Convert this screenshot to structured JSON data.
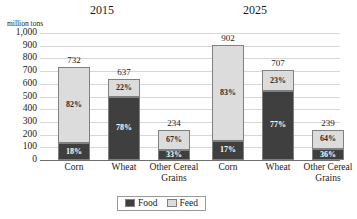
{
  "chart_data": {
    "type": "bar",
    "subtype": "stacked-bar-percent",
    "title": "",
    "panels": [
      {
        "label": "2015",
        "categories": [
          "Corn",
          "Wheat",
          "Other Cereal Grains"
        ],
        "totals": [
          732,
          637,
          234
        ],
        "series": [
          {
            "name": "Food",
            "percents": [
              18,
              78,
              33
            ],
            "percent_labels": [
              "18%",
              "78%",
              "33%"
            ]
          },
          {
            "name": "Feed",
            "percents": [
              82,
              22,
              67
            ],
            "percent_labels": [
              "82%",
              "22%",
              "67%"
            ]
          }
        ]
      },
      {
        "label": "2025",
        "categories": [
          "Corn",
          "Wheat",
          "Other Cereal Grains"
        ],
        "totals": [
          902,
          707,
          239
        ],
        "series": [
          {
            "name": "Food",
            "percents": [
              17,
              77,
              36
            ],
            "percent_labels": [
              "17%",
              "77%",
              "36%"
            ]
          },
          {
            "name": "Feed",
            "percents": [
              83,
              23,
              64
            ],
            "percent_labels": [
              "83%",
              "23%",
              "64%"
            ]
          }
        ]
      }
    ],
    "xlabel": "",
    "ylabel": "million tons",
    "ylim": [
      0,
      1000
    ],
    "ytick_labels": [
      "1,000",
      "900",
      "800",
      "700",
      "600",
      "500",
      "400",
      "300",
      "200",
      "100",
      "0"
    ],
    "ytick_values": [
      1000,
      900,
      800,
      700,
      600,
      500,
      400,
      300,
      200,
      100,
      0
    ],
    "grid": true,
    "legend_position": "bottom",
    "legend": [
      "Food",
      "Feed"
    ],
    "colors": {
      "food": "#3f3f3f",
      "feed": "#dcdcdc",
      "gridline": "#d7d7d7",
      "axis": "#6f6f6f"
    }
  },
  "axis": {
    "unit_label": "million tons",
    "ticks": [
      {
        "label": "1,000"
      },
      {
        "label": "900"
      },
      {
        "label": "800"
      },
      {
        "label": "700"
      },
      {
        "label": "600"
      },
      {
        "label": "500"
      },
      {
        "label": "400"
      },
      {
        "label": "300"
      },
      {
        "label": "200"
      },
      {
        "label": "100"
      },
      {
        "label": "0"
      }
    ]
  },
  "panels": {
    "left": {
      "title": "2015",
      "bars": [
        {
          "category": "Corn",
          "total_label": "732",
          "food_label": "18%",
          "feed_label": "82%"
        },
        {
          "category": "Wheat",
          "total_label": "637",
          "food_label": "78%",
          "feed_label": "22%"
        },
        {
          "category": "Other Cereal Grains",
          "category_line1": "Other Cereal",
          "category_line2": "Grains",
          "total_label": "234",
          "food_label": "33%",
          "feed_label": "67%"
        }
      ]
    },
    "right": {
      "title": "2025",
      "bars": [
        {
          "category": "Corn",
          "total_label": "902",
          "food_label": "17%",
          "feed_label": "83%"
        },
        {
          "category": "Wheat",
          "total_label": "707",
          "food_label": "77%",
          "feed_label": "23%"
        },
        {
          "category": "Other Cereal Grains",
          "category_line1": "Other Cereal",
          "category_line2": "Grains",
          "total_label": "239",
          "food_label": "36%",
          "feed_label": "64%"
        }
      ]
    }
  },
  "legend": {
    "food_label": "Food",
    "feed_label": "Feed"
  }
}
